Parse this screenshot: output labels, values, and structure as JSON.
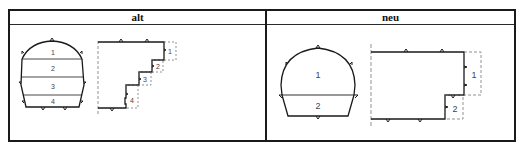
{
  "table": {
    "columns": [
      {
        "key": "alt",
        "header": "alt"
      },
      {
        "key": "neu",
        "header": "neu"
      }
    ]
  },
  "alt": {
    "cross_section": {
      "segments": [
        "1",
        "2",
        "3",
        "4"
      ]
    },
    "longitudinal_section": {
      "steps": [
        "1",
        "2",
        "3",
        "4"
      ]
    }
  },
  "neu": {
    "cross_section": {
      "segments": [
        "1",
        "2"
      ]
    },
    "longitudinal_section": {
      "steps": [
        "1",
        "2"
      ]
    }
  },
  "colors": {
    "line": "#1a1a1a",
    "dashed": "#777777",
    "label": "#444444"
  }
}
